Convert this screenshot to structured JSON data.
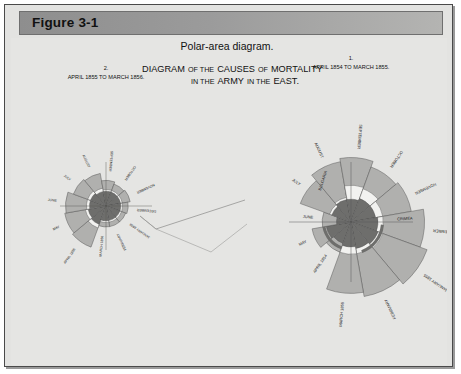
{
  "figure": {
    "header_label": "Figure 3-1",
    "caption": "Polar-area diagram."
  },
  "diagram": {
    "title_line1": "DIAGRAM OF THE CAUSES OF MORTALITY",
    "title_line2": "IN THE ARMY IN THE EAST.",
    "title_word_1": "DIAGRAM",
    "title_word_2": "OF THE",
    "title_word_3": "CAUSES",
    "title_word_4": "OF",
    "title_word_5": "MORTALITY",
    "title_word_6": "IN THE",
    "title_word_7": "ARMY",
    "title_word_8": "IN THE",
    "title_word_9": "EAST."
  },
  "colors": {
    "page_background": "#e5e5e3",
    "frame_border": "#4a4a4a",
    "header_gray": "#9b9b9b",
    "wedge_light": "#b0b0ae",
    "wedge_mid": "#8d8d8b",
    "wedge_dark": "#6e6e6c",
    "wedge_white": "#f2f2f0",
    "outline": "#4f4f4f",
    "text": "#111111"
  },
  "chart_data": {
    "type": "pie",
    "chart_subtype": "polar-area-rose",
    "caption": "Polar-area diagram.",
    "legend_position": "none",
    "grid": false,
    "panels": [
      {
        "panel_number": "1.",
        "panel_id": "right",
        "range_label": "APRIL 1854 TO MARCH 1855.",
        "region_markers": [
          "BULGARIA",
          "CRIMEA"
        ],
        "categories": [
          "APRIL 1854",
          "MAY",
          "JUNE",
          "JULY",
          "AUGUST",
          "SEPTEMBER",
          "OCTOBER",
          "NOVEMBER",
          "DECEMBER",
          "JANUARY 1855",
          "FEBRUARY",
          "MARCH 1855"
        ],
        "series": [
          {
            "name": "Preventable disease",
            "values": [
              5,
              9,
              6,
              23,
              30,
              27,
              21,
              26,
              42,
              52,
              45,
              39
            ]
          },
          {
            "name": "Wounds",
            "values": [
              0,
              0,
              0,
              1,
              1,
              8,
              6,
              4,
              3,
              3,
              3,
              4
            ]
          },
          {
            "name": "All other causes",
            "values": [
              5,
              6,
              2,
              4,
              5,
              5,
              6,
              6,
              7,
              8,
              7,
              6
            ]
          }
        ]
      },
      {
        "panel_number": "2.",
        "panel_id": "left",
        "range_label": "APRIL 1855 TO MARCH 1856.",
        "region_markers": [],
        "categories": [
          "APRIL 1855",
          "MAY",
          "JUNE",
          "JULY",
          "AUGUST",
          "SEPTEMBER",
          "OCTOBER",
          "NOVEMBER",
          "DECEMBER",
          "JANUARY 1856",
          "FEBRUARY",
          "MARCH 1856"
        ],
        "series": [
          {
            "name": "Preventable disease",
            "values": [
              25,
              24,
              23,
              15,
              14,
              7,
              5,
              6,
              4,
              3,
              3,
              3
            ]
          },
          {
            "name": "Wounds",
            "values": [
              3,
              2,
              2,
              2,
              2,
              1,
              1,
              1,
              1,
              1,
              1,
              1
            ]
          },
          {
            "name": "All other causes",
            "values": [
              7,
              6,
              5,
              5,
              4,
              4,
              4,
              4,
              4,
              4,
              4,
              4
            ]
          }
        ]
      }
    ]
  }
}
